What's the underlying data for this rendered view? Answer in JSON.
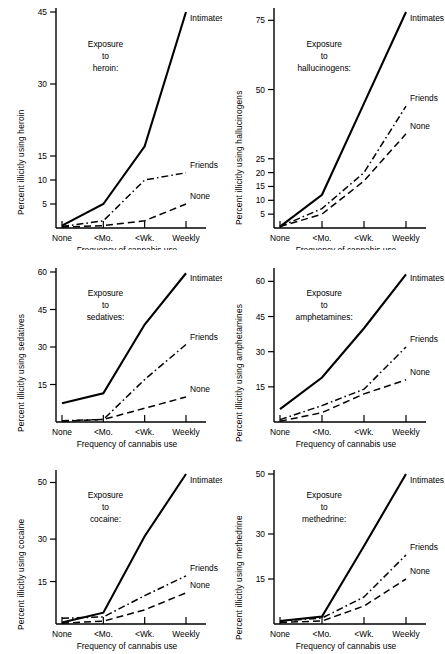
{
  "figure": {
    "x_axis_title": "Frequency of cannabis use",
    "categories": [
      "None",
      "<Mo.",
      "<Wk.",
      "Weekly"
    ],
    "series_names": [
      "Intimates",
      "Friends",
      "None"
    ],
    "line_styles": {
      "Intimates": "solid",
      "Friends": "dash-dot",
      "None": "dashed"
    },
    "line_color": "#000000"
  },
  "chart_data": [
    {
      "type": "line",
      "panel": "top-left",
      "title": "",
      "exposure_caption": [
        "Exposure",
        "to",
        "heroin:"
      ],
      "xlabel": "Frequency of cannabis use",
      "ylabel": "Percent illicitly using heroin",
      "categories": [
        "None",
        "<Mo.",
        "<Wk.",
        "Weekly"
      ],
      "yticks": [
        5,
        10,
        15,
        30,
        45
      ],
      "ylim": [
        0,
        45
      ],
      "grid": false,
      "legend_position": "inline-right-of-line-ends",
      "series": [
        {
          "name": "Intimates",
          "style": "solid",
          "values": [
            0.5,
            5.0,
            17.0,
            45.0
          ]
        },
        {
          "name": "Friends",
          "style": "dash-dot",
          "values": [
            0.3,
            1.5,
            10.0,
            11.5
          ]
        },
        {
          "name": "None",
          "style": "dashed",
          "values": [
            0.2,
            0.5,
            1.5,
            5.0
          ]
        }
      ]
    },
    {
      "type": "line",
      "panel": "top-right",
      "title": "",
      "exposure_caption": [
        "Exposure",
        "to",
        "hallucinogens:"
      ],
      "xlabel": "Frequency of cannabis use",
      "ylabel": "Percent illicitly using hallucinogens",
      "categories": [
        "None",
        "<Mo.",
        "<Wk.",
        "Weekly"
      ],
      "yticks": [
        5,
        10,
        15,
        20,
        25,
        50,
        75
      ],
      "ylim": [
        0,
        78
      ],
      "grid": false,
      "legend_position": "inline-right-of-line-ends",
      "series": [
        {
          "name": "Intimates",
          "style": "solid",
          "values": [
            0.5,
            12.0,
            45.0,
            78.0
          ]
        },
        {
          "name": "Friends",
          "style": "dash-dot",
          "values": [
            0.5,
            7.0,
            20.0,
            44.0
          ]
        },
        {
          "name": "None",
          "style": "dashed",
          "values": [
            0.5,
            5.0,
            17.0,
            34.0
          ]
        }
      ]
    },
    {
      "type": "line",
      "panel": "middle-left",
      "title": "",
      "exposure_caption": [
        "Exposure",
        "to",
        "sedatives:"
      ],
      "xlabel": "Frequency of cannabis use",
      "ylabel": "Percent illicitly using sedatives",
      "categories": [
        "None",
        "<Mo.",
        "<Wk.",
        "Weekly"
      ],
      "yticks": [
        15,
        30,
        45,
        60
      ],
      "ylim": [
        0,
        60
      ],
      "grid": false,
      "legend_position": "inline-right-of-line-ends",
      "series": [
        {
          "name": "Intimates",
          "style": "solid",
          "values": [
            7.5,
            11.5,
            39.0,
            59.5
          ]
        },
        {
          "name": "Friends",
          "style": "dash-dot",
          "values": [
            0.5,
            1.0,
            17.0,
            31.0
          ]
        },
        {
          "name": "None",
          "style": "dashed",
          "values": [
            0.3,
            1.0,
            5.5,
            10.0
          ]
        }
      ]
    },
    {
      "type": "line",
      "panel": "middle-right",
      "title": "",
      "exposure_caption": [
        "Exposure",
        "to",
        "amphetamines:"
      ],
      "xlabel": "Frequency of cannabis use",
      "ylabel": "Percent illicitly using amphetamines",
      "categories": [
        "None",
        "<Mo.",
        "<Wk.",
        "Weekly"
      ],
      "yticks": [
        15,
        30,
        45,
        60
      ],
      "ylim": [
        0,
        64
      ],
      "grid": false,
      "legend_position": "inline-right-of-line-ends",
      "series": [
        {
          "name": "Intimates",
          "style": "solid",
          "values": [
            5.5,
            19.0,
            40.0,
            63.0
          ]
        },
        {
          "name": "Friends",
          "style": "dash-dot",
          "values": [
            1.0,
            7.0,
            14.0,
            32.0
          ]
        },
        {
          "name": "None",
          "style": "dashed",
          "values": [
            0.3,
            4.0,
            12.0,
            18.0
          ]
        }
      ]
    },
    {
      "type": "line",
      "panel": "bottom-left",
      "title": "",
      "exposure_caption": [
        "Exposure",
        "to",
        "cocaine:"
      ],
      "xlabel": "Frequency of cannabis use",
      "ylabel": "Percent illicitly using cocaine",
      "categories": [
        "None",
        "<Mo.",
        "<Wk.",
        "Weekly"
      ],
      "yticks": [
        15,
        30,
        50
      ],
      "ylim": [
        0,
        53
      ],
      "grid": false,
      "legend_position": "inline-right-of-line-ends",
      "series": [
        {
          "name": "Intimates",
          "style": "solid",
          "values": [
            0.5,
            4.0,
            31.0,
            53.0
          ]
        },
        {
          "name": "Friends",
          "style": "dash-dot",
          "values": [
            2.0,
            2.5,
            10.0,
            17.0
          ]
        },
        {
          "name": "None",
          "style": "dashed",
          "values": [
            0.3,
            1.0,
            5.0,
            11.0
          ]
        }
      ]
    },
    {
      "type": "line",
      "panel": "bottom-right",
      "title": "",
      "exposure_caption": [
        "Exposure",
        "to",
        "methedrine:"
      ],
      "xlabel": "Frequency of cannabis use",
      "ylabel": "Percent illicitly using methedrine",
      "categories": [
        "None",
        "<Mo.",
        "<Wk.",
        "Weekly"
      ],
      "yticks": [
        15,
        30,
        50
      ],
      "ylim": [
        0,
        50
      ],
      "grid": false,
      "legend_position": "inline-right-of-line-ends",
      "series": [
        {
          "name": "Intimates",
          "style": "solid",
          "values": [
            1.0,
            2.5,
            26.0,
            50.0
          ]
        },
        {
          "name": "Friends",
          "style": "dash-dot",
          "values": [
            1.0,
            2.0,
            9.0,
            23.0
          ]
        },
        {
          "name": "None",
          "style": "dashed",
          "values": [
            0.5,
            1.0,
            6.0,
            15.0
          ]
        }
      ]
    }
  ]
}
